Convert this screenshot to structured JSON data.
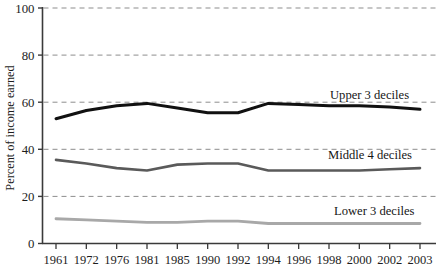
{
  "chart_data": {
    "type": "line",
    "title": "",
    "xlabel": "",
    "ylabel": "Percent of income earned",
    "categories": [
      "1961",
      "1972",
      "1976",
      "1981",
      "1985",
      "1990",
      "1992",
      "1994",
      "1996",
      "1998",
      "2000",
      "2002",
      "2003"
    ],
    "ylim": [
      0,
      100
    ],
    "yticks": [
      0,
      20,
      40,
      60,
      80,
      100
    ],
    "grid": "horizontal-dashed",
    "legend_position": "inline-right",
    "series": [
      {
        "name": "Upper 3 deciles",
        "color": "#111111",
        "values": [
          53.0,
          56.5,
          58.5,
          59.5,
          57.5,
          55.5,
          55.5,
          59.5,
          59.0,
          58.5,
          58.5,
          58.0,
          57.0
        ]
      },
      {
        "name": "Middle 4 deciles",
        "color": "#5a5a5a",
        "values": [
          35.5,
          34.0,
          32.0,
          31.0,
          33.5,
          34.0,
          34.0,
          31.0,
          31.0,
          31.0,
          31.0,
          31.5,
          32.0
        ]
      },
      {
        "name": "Lower 3 deciles",
        "color": "#a8a8a8",
        "values": [
          10.5,
          10.0,
          9.5,
          9.0,
          9.0,
          9.5,
          9.5,
          8.5,
          8.5,
          8.5,
          8.5,
          8.5,
          8.5
        ]
      }
    ]
  },
  "axes": {
    "y_title": "Percent of income earned",
    "y_tick_labels": [
      "100",
      "80",
      "60",
      "40",
      "20",
      "0"
    ],
    "x_tick_labels": [
      "1961",
      "1972",
      "1976",
      "1981",
      "1985",
      "1990",
      "1992",
      "1994",
      "1996",
      "1998",
      "2000",
      "2002",
      "2003"
    ]
  },
  "legend": {
    "upper_label": "Upper 3 deciles",
    "middle_label": "Middle 4 deciles",
    "lower_label": "Lower 3 deciles"
  },
  "colors": {
    "upper": "#111111",
    "middle": "#5a5a5a",
    "lower": "#a8a8a8",
    "grid": "#8d8d8d",
    "axis": "#3a3a3a"
  }
}
